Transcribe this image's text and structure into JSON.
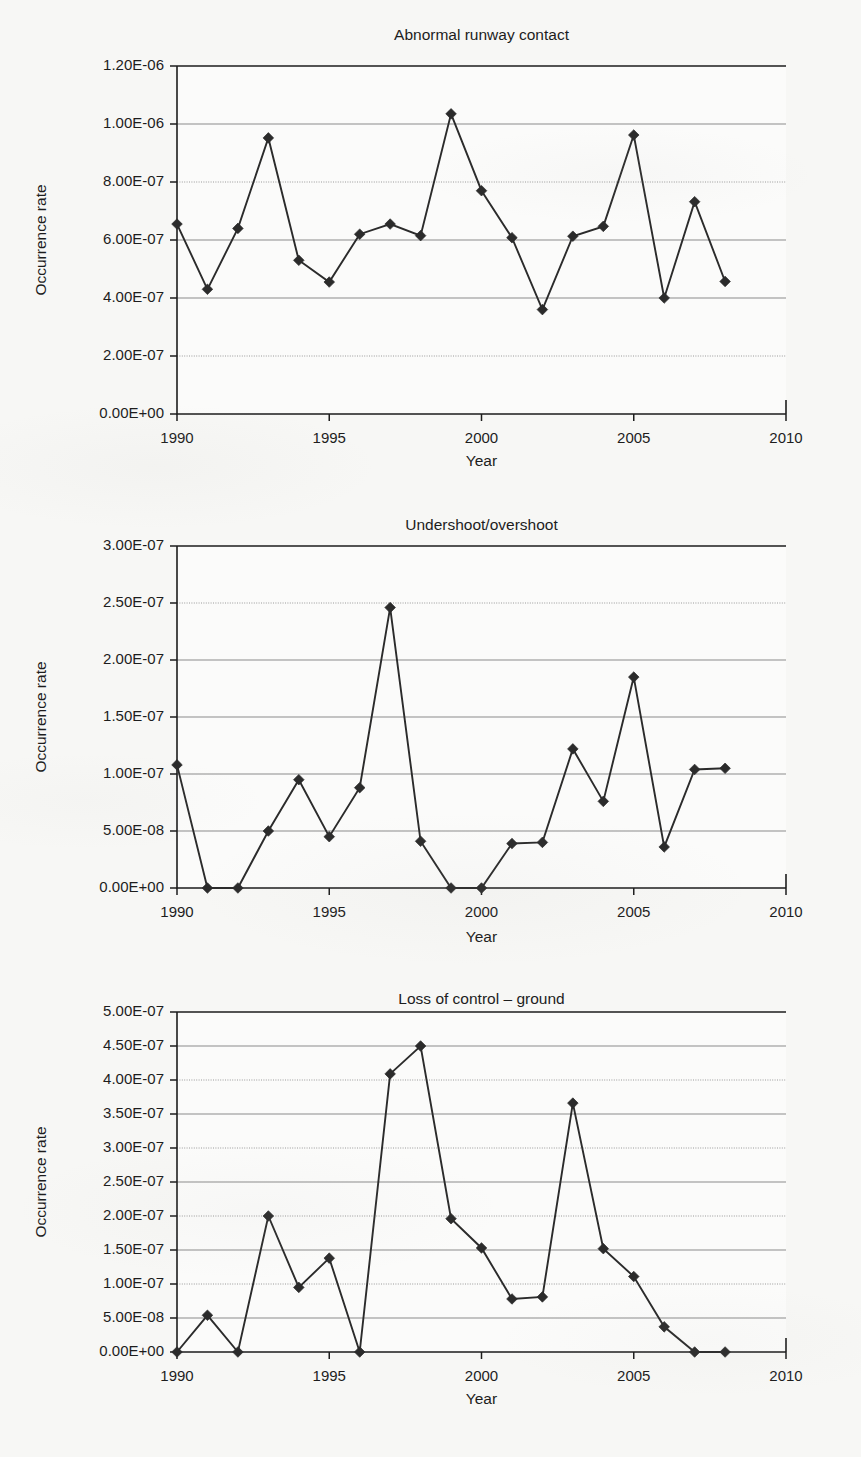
{
  "page": {
    "background_color": "#f7f7f5",
    "ink_color": "#1d1d1d",
    "marker_color": "#2b2b2b"
  },
  "charts": [
    {
      "id": "abnormal-runway-contact",
      "title": "Abnormal runway contact",
      "xlabel": "Year",
      "ylabel": "Occurrence rate",
      "y_ticks": [
        "0.00E+00",
        "2.00E-07",
        "4.00E-07",
        "6.00E-07",
        "8.00E-07",
        "1.00E-06",
        "1.20E-06"
      ],
      "y_tick_values": [
        0,
        2e-07,
        4e-07,
        6e-07,
        8e-07,
        1e-06,
        1.2e-06
      ],
      "x_ticks": [
        "1990",
        "1995",
        "2000",
        "2005",
        "2010"
      ],
      "x_tick_values": [
        1990,
        1995,
        2000,
        2005,
        2010
      ]
    },
    {
      "id": "undershoot-overshoot",
      "title": "Undershoot/overshoot",
      "xlabel": "Year",
      "ylabel": "Occurrence rate",
      "y_ticks": [
        "0.00E+00",
        "5.00E-08",
        "1.00E-07",
        "1.50E-07",
        "2.00E-07",
        "2.50E-07",
        "3.00E-07"
      ],
      "y_tick_values": [
        0,
        5e-08,
        1e-07,
        1.5e-07,
        2e-07,
        2.5e-07,
        3e-07
      ],
      "x_ticks": [
        "1990",
        "1995",
        "2000",
        "2005",
        "2010"
      ],
      "x_tick_values": [
        1990,
        1995,
        2000,
        2005,
        2010
      ]
    },
    {
      "id": "loss-of-control-ground",
      "title": "Loss of control – ground",
      "xlabel": "Year",
      "ylabel": "Occurrence rate",
      "y_ticks": [
        "0.00E+00",
        "5.00E-08",
        "1.00E-07",
        "1.50E-07",
        "2.00E-07",
        "2.50E-07",
        "3.00E-07",
        "3.50E-07",
        "4.00E-07",
        "4.50E-07",
        "5.00E-07"
      ],
      "y_tick_values": [
        0,
        5e-08,
        1e-07,
        1.5e-07,
        2e-07,
        2.5e-07,
        3e-07,
        3.5e-07,
        4e-07,
        4.5e-07,
        5e-07
      ],
      "x_ticks": [
        "1990",
        "1995",
        "2000",
        "2005",
        "2010"
      ],
      "x_tick_values": [
        1990,
        1995,
        2000,
        2005,
        2010
      ]
    }
  ],
  "chart_data": [
    {
      "type": "line",
      "title": "Abnormal runway contact",
      "xlabel": "Year",
      "ylabel": "Occurrence rate",
      "xlim": [
        1990,
        2010
      ],
      "ylim": [
        0,
        1.2e-06
      ],
      "grid": true,
      "legend": false,
      "marker": "diamond",
      "x": [
        1990,
        1991,
        1992,
        1993,
        1994,
        1995,
        1996,
        1997,
        1998,
        1999,
        2000,
        2001,
        2002,
        2003,
        2004,
        2005,
        2006,
        2007,
        2008
      ],
      "values": [
        6.55e-07,
        4.3e-07,
        6.4e-07,
        9.52e-07,
        5.3e-07,
        4.55e-07,
        6.2e-07,
        6.55e-07,
        6.15e-07,
        1.035e-06,
        7.7e-07,
        6.08e-07,
        3.6e-07,
        6.13e-07,
        6.47e-07,
        9.62e-07,
        4e-07,
        7.32e-07,
        4.57e-07
      ]
    },
    {
      "type": "line",
      "title": "Undershoot/overshoot",
      "xlabel": "Year",
      "ylabel": "Occurrence rate",
      "xlim": [
        1990,
        2010
      ],
      "ylim": [
        0,
        3e-07
      ],
      "grid": true,
      "legend": false,
      "marker": "diamond",
      "x": [
        1990,
        1991,
        1992,
        1993,
        1994,
        1995,
        1996,
        1997,
        1998,
        1999,
        2000,
        2001,
        2002,
        2003,
        2004,
        2005,
        2006,
        2007,
        2008
      ],
      "values": [
        1.08e-07,
        0.0,
        0.0,
        5e-08,
        9.5e-08,
        4.5e-08,
        8.8e-08,
        2.46e-07,
        4.1e-08,
        0.0,
        0.0,
        3.9e-08,
        4e-08,
        1.22e-07,
        7.6e-08,
        1.85e-07,
        3.6e-08,
        1.04e-07,
        1.05e-07
      ]
    },
    {
      "type": "line",
      "title": "Loss of control – ground",
      "xlabel": "Year",
      "ylabel": "Occurrence rate",
      "xlim": [
        1990,
        2010
      ],
      "ylim": [
        0,
        5e-07
      ],
      "grid": true,
      "legend": false,
      "marker": "diamond",
      "x": [
        1990,
        1991,
        1992,
        1993,
        1994,
        1995,
        1996,
        1997,
        1998,
        1999,
        2000,
        2001,
        2002,
        2003,
        2004,
        2005,
        2006,
        2007,
        2008
      ],
      "values": [
        0.0,
        5.4e-08,
        0.0,
        2e-07,
        9.5e-08,
        1.38e-07,
        0.0,
        4.09e-07,
        4.5e-07,
        1.96e-07,
        1.53e-07,
        7.8e-08,
        8.1e-08,
        3.66e-07,
        1.52e-07,
        1.11e-07,
        3.7e-08,
        0.0,
        0.0
      ]
    }
  ]
}
